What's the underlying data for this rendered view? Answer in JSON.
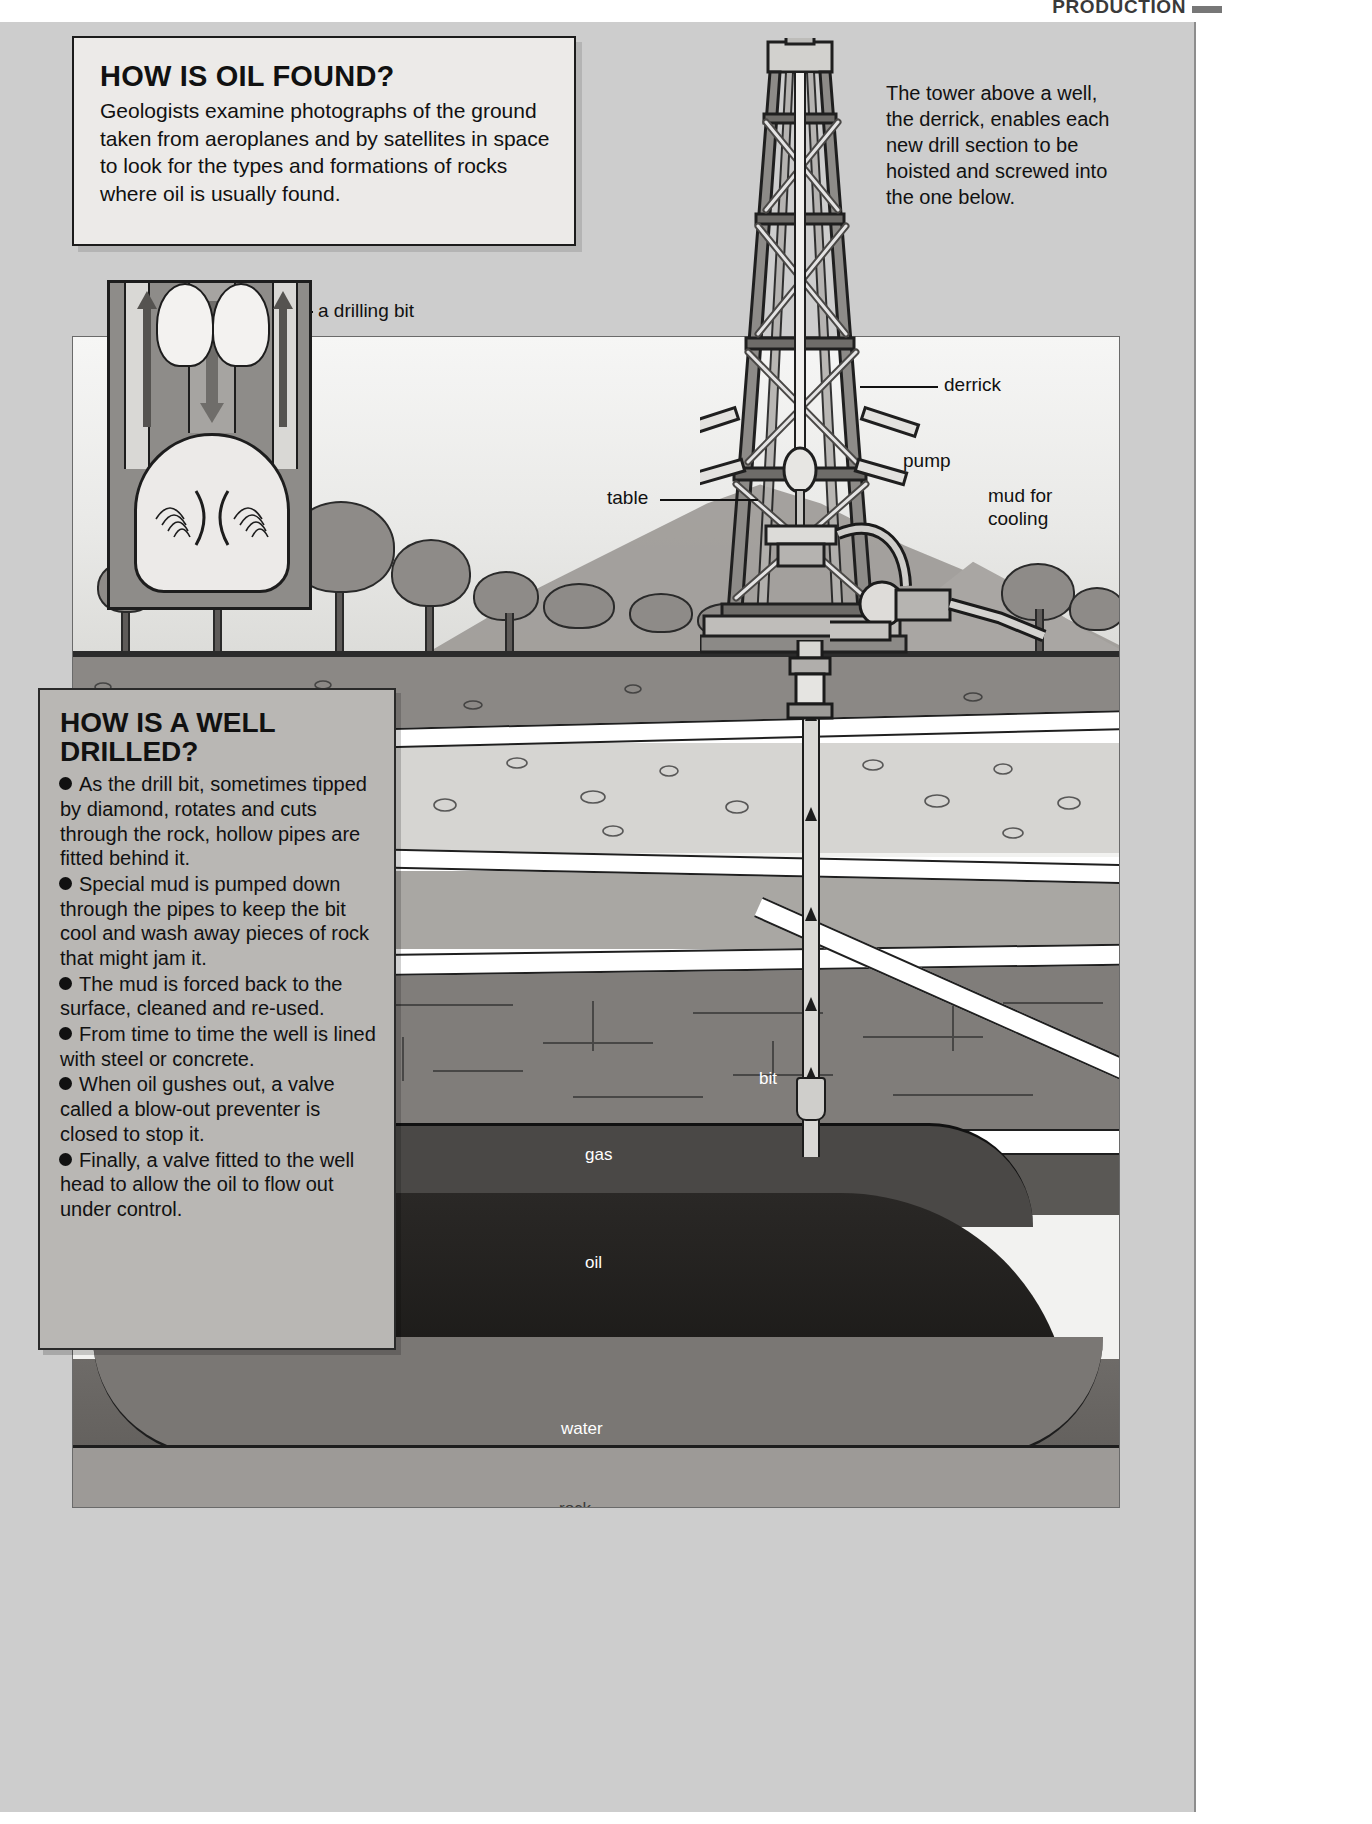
{
  "running_head": {
    "text": "PRODUCTION",
    "section_number": "3.2"
  },
  "box_oil_found": {
    "title": "HOW IS OIL FOUND?",
    "body": "Geologists examine photographs of the ground taken from aeroplanes and by satellites in space to look for the types and formations of rocks where oil is usually found."
  },
  "box_derrick_note": {
    "text": "The tower above a well, the derrick, enables each new drill section to be hoisted and screwed into the one below."
  },
  "box_well_drilled": {
    "title_line1": "HOW IS A WELL",
    "title_line2": "DRILLED?",
    "bullets": [
      "As the drill bit, sometimes tipped by diamond, rotates and cuts through the rock, hollow pipes are fitted behind it.",
      "Special mud is pumped down through the pipes to keep the bit cool and wash away pieces of rock that might jam it.",
      "The mud is forced back to the surface, cleaned and re-used.",
      "From time to time the well is lined with steel or concrete.",
      "When oil gushes out, a valve called a blow-out preventer is closed to stop it.",
      "Finally, a valve fitted to the well head to allow the oil to flow out under control."
    ]
  },
  "callouts": {
    "drilling_bit": "a drilling bit",
    "derrick": "derrick",
    "pump": "pump",
    "mud_for_cooling_l1": "mud for",
    "mud_for_cooling_l2": "cooling",
    "table": "table",
    "bit": "bit"
  },
  "strata_labels": {
    "gas": "gas",
    "oil": "oil",
    "water": "water",
    "rock": "rock"
  },
  "colors": {
    "page_background": "#cdcdcd",
    "panel_background": "#f2f2f0",
    "infobox_light": "#eceae8",
    "infobox_grey": "#b9b7b4",
    "ink": "#111111",
    "topsoil": "#8b8885",
    "pebble_layer": "#d6d5d2",
    "sand_layer": "#a9a7a3",
    "shale_layer": "#807d7a",
    "cap_rock": "#5a5855",
    "gas_dome": "#4a4846",
    "oil_body": "#171614",
    "water_body": "#6e6b68"
  }
}
